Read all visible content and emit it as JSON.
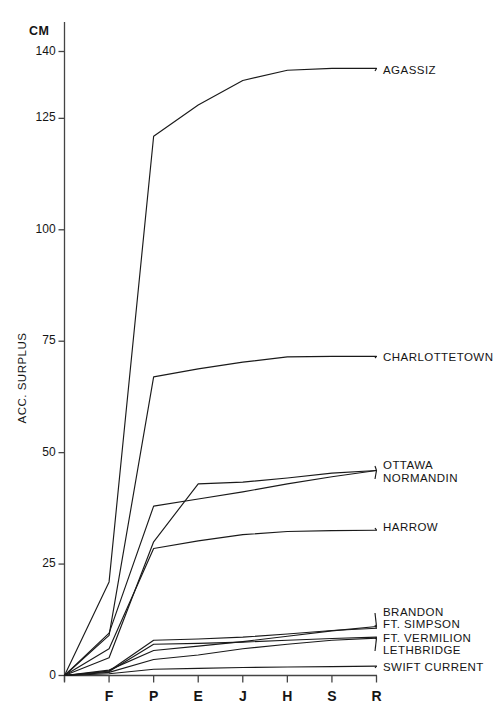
{
  "chart_data": {
    "type": "line",
    "title": "",
    "subtitle": "",
    "unit_label": "CM",
    "ylabel": "ACC. SURPLUS",
    "xlabel": "",
    "x_categories": [
      "",
      "F",
      "P",
      "E",
      "J",
      "H",
      "S",
      "R"
    ],
    "x_tick_labels": [
      "F",
      "P",
      "E",
      "J",
      "H",
      "S",
      "R"
    ],
    "y_tick_labels": [
      "0",
      "25",
      "50",
      "75",
      "100",
      "125",
      "140"
    ],
    "y_tick_values": [
      0,
      25,
      50,
      75,
      100,
      125,
      140
    ],
    "ylim": [
      0,
      145
    ],
    "grid": false,
    "legend_position": "right-inline",
    "series": [
      {
        "name": "AGASSIZ",
        "values": [
          0,
          21.0,
          121.0,
          128.0,
          133.5,
          135.8,
          136.2,
          136.2
        ]
      },
      {
        "name": "CHARLOTTETOWN",
        "values": [
          0,
          9.0,
          67.0,
          68.8,
          70.3,
          71.5,
          71.6,
          71.6
        ]
      },
      {
        "name": "OTTAWA",
        "values": [
          0,
          4.0,
          30.0,
          43.0,
          43.4,
          44.3,
          45.4,
          46.0
        ]
      },
      {
        "name": "NORMANDIN",
        "values": [
          0,
          9.5,
          38.0,
          39.6,
          41.2,
          43.0,
          44.6,
          46.0
        ]
      },
      {
        "name": "HARROW",
        "values": [
          0,
          6.0,
          28.5,
          30.2,
          31.6,
          32.3,
          32.5,
          32.6
        ]
      },
      {
        "name": "BRANDON",
        "values": [
          0,
          1.2,
          5.6,
          6.6,
          7.6,
          8.8,
          10.0,
          11.0
        ]
      },
      {
        "name": "FT. SIMPSON",
        "values": [
          0,
          1.0,
          7.9,
          8.2,
          8.6,
          9.3,
          10.1,
          10.6
        ]
      },
      {
        "name": "FT. VERMILION",
        "values": [
          0,
          0.9,
          7.0,
          7.2,
          7.5,
          7.9,
          8.3,
          8.6
        ]
      },
      {
        "name": "LETHBRIDGE",
        "values": [
          0,
          0.7,
          3.6,
          4.6,
          6.0,
          7.0,
          7.9,
          8.4
        ]
      },
      {
        "name": "SWIFT CURRENT",
        "values": [
          0,
          0.4,
          1.4,
          1.6,
          1.8,
          1.9,
          2.0,
          2.1
        ]
      }
    ],
    "legend_entries": [
      {
        "label": "AGASSIZ",
        "y_px": 71
      },
      {
        "label": "CHARLOTTETOWN",
        "y_px": 358
      },
      {
        "label": "OTTAWA",
        "y_px": 466
      },
      {
        "label": "NORMANDIN",
        "y_px": 479
      },
      {
        "label": "HARROW",
        "y_px": 528
      },
      {
        "label": "BRANDON",
        "y_px": 613
      },
      {
        "label": "FT. SIMPSON",
        "y_px": 625
      },
      {
        "label": "FT. VERMILION",
        "y_px": 639
      },
      {
        "label": "LETHBRIDGE",
        "y_px": 651
      },
      {
        "label": "SWIFT CURRENT",
        "y_px": 668
      }
    ],
    "line_color": "#1a1a1a",
    "axis_color": "#444444",
    "background_color": "#ffffff"
  }
}
